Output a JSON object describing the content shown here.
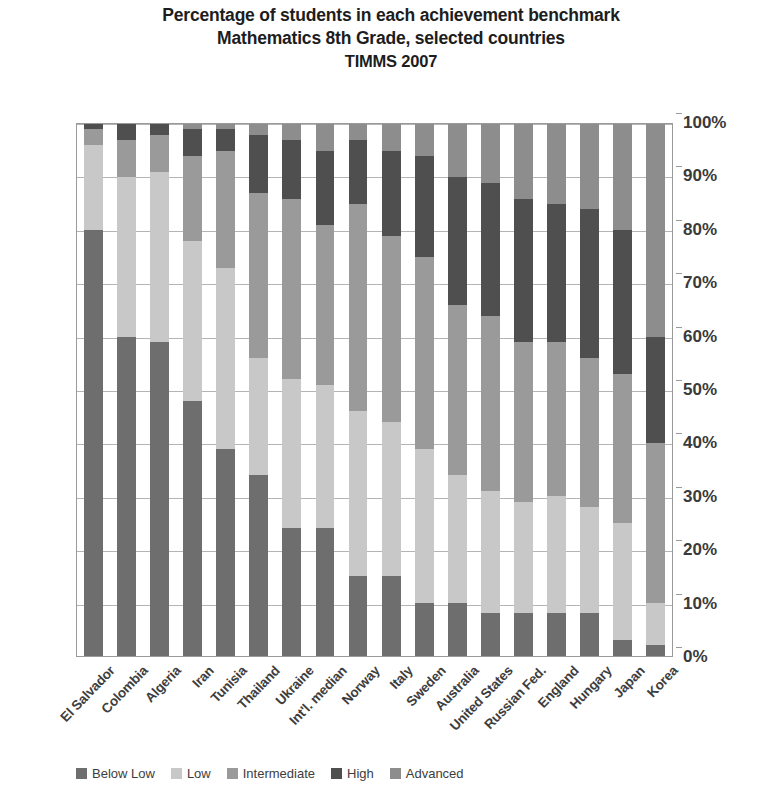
{
  "title": {
    "line1": "Percentage of students in each achievement benchmark",
    "line2": "Mathematics 8th Grade, selected countries",
    "line3": "TIMMS 2007"
  },
  "axis": {
    "y_ticks": [
      "100%",
      "90%",
      "80%",
      "70%",
      "60%",
      "50%",
      "40%",
      "30%",
      "20%",
      "10%",
      "0%"
    ],
    "y_label": "",
    "x_label": ""
  },
  "legend": {
    "position": "bottom",
    "items": [
      {
        "label": "Below Low",
        "color": "#6e6e6e"
      },
      {
        "label": "Low",
        "color": "#c8c8c8"
      },
      {
        "label": "Intermediate",
        "color": "#9a9a9a"
      },
      {
        "label": "High",
        "color": "#4f4f4f"
      },
      {
        "label": "Advanced",
        "color": "#8d8d8d"
      }
    ]
  },
  "colors": {
    "below_low": "#6e6e6e",
    "low": "#c8c8c8",
    "intermediate": "#9a9a9a",
    "high": "#4f4f4f",
    "advanced": "#8d8d8d",
    "grid": "#b4b4b4",
    "frame": "#9a9a9a",
    "text": "#2b2b2b"
  },
  "chart_data": {
    "type": "bar",
    "subtype": "stacked-100-percent",
    "xlabel": "",
    "ylabel": "",
    "ylim": [
      0,
      100
    ],
    "ytick_values": [
      0,
      10,
      20,
      30,
      40,
      50,
      60,
      70,
      80,
      90,
      100
    ],
    "grid": true,
    "legend_position": "bottom",
    "categories": [
      "El Salvador",
      "Colombia",
      "Algeria",
      "Iran",
      "Tunisia",
      "Thailand",
      "Ukraine",
      "Int'l. median",
      "Norway",
      "Italy",
      "Sweden",
      "Australia",
      "United States",
      "Russian Fed.",
      "England",
      "Hungary",
      "Japan",
      "Korea"
    ],
    "series": [
      {
        "name": "Below Low",
        "color": "#6e6e6e",
        "values": [
          80,
          60,
          59,
          48,
          39,
          34,
          24,
          24,
          15,
          15,
          10,
          10,
          8,
          8,
          8,
          8,
          3,
          2
        ]
      },
      {
        "name": "Low",
        "color": "#c8c8c8",
        "values": [
          16,
          30,
          32,
          30,
          34,
          22,
          28,
          27,
          31,
          29,
          29,
          24,
          23,
          21,
          22,
          20,
          22,
          8
        ]
      },
      {
        "name": "Intermediate",
        "color": "#9a9a9a",
        "values": [
          3,
          7,
          7,
          16,
          22,
          31,
          34,
          30,
          39,
          35,
          36,
          32,
          33,
          30,
          29,
          28,
          28,
          30
        ]
      },
      {
        "name": "High",
        "color": "#4f4f4f",
        "values": [
          1,
          3,
          2,
          5,
          4,
          11,
          11,
          14,
          12,
          16,
          19,
          24,
          25,
          27,
          26,
          28,
          27,
          20
        ]
      },
      {
        "name": "Advanced",
        "color": "#8d8d8d",
        "values": [
          0,
          0,
          0,
          1,
          1,
          2,
          3,
          5,
          3,
          5,
          6,
          10,
          11,
          14,
          15,
          16,
          20,
          40
        ]
      }
    ]
  }
}
